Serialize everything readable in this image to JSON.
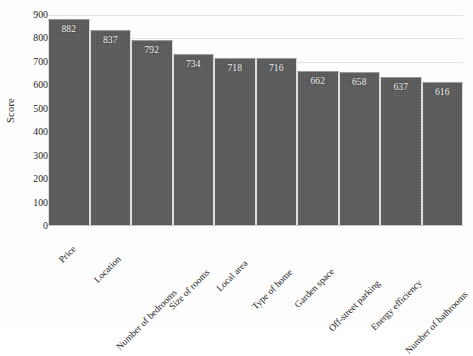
{
  "chart_data": {
    "type": "bar",
    "title": "",
    "subtitle": "",
    "xlabel": "",
    "ylabel": "Score",
    "ylim": [
      0,
      900
    ],
    "yticks": [
      900,
      800,
      700,
      600,
      500,
      400,
      300,
      200,
      100,
      0
    ],
    "grid": true,
    "legend_position": "none",
    "orientation": "vertical",
    "bar_color": "#5a5a5a",
    "value_label_color": "#f2f2f2",
    "gridline_color": "#e2e2e2",
    "categories": [
      "Price",
      "Location",
      "Number of bedrooms",
      "Size of rooms",
      "Local area",
      "Type of home",
      "Garden space",
      "Off-street parking",
      "Energy efficiency",
      "Number of bathrooms"
    ],
    "values": [
      882,
      837,
      792,
      734,
      718,
      716,
      662,
      658,
      637,
      616
    ],
    "value_labels": [
      "882",
      "837",
      "792",
      "734",
      "718",
      "716",
      "662",
      "658",
      "637",
      "616"
    ],
    "annotations": []
  }
}
